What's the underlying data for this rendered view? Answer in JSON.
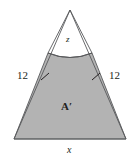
{
  "figure": {
    "name": "triangle-with-curved-segment-diagram",
    "background_color": "#ffffff",
    "stroke_color": "#58595b",
    "shaded_fill_color": "#b3b3b3",
    "label_color": "#231f20",
    "labels": {
      "top_region": "z",
      "shaded_region": "A′",
      "base": "x",
      "left_side": "12",
      "right_side": "12"
    },
    "geometry": {
      "apex": [
        70,
        10
      ],
      "base_left": [
        14,
        139
      ],
      "base_right": [
        126,
        139
      ],
      "arc_left_end": [
        48,
        53
      ],
      "arc_right_end": [
        92,
        53
      ],
      "arc_mid_dip": [
        70,
        61
      ],
      "tick_left": [
        45,
        77
      ],
      "tick_right": [
        96,
        77
      ]
    }
  }
}
